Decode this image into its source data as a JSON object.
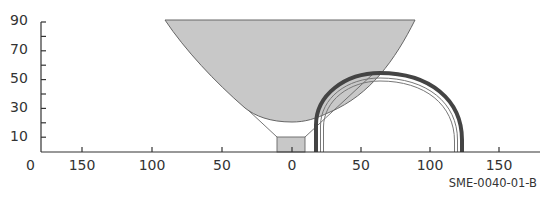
{
  "figure": {
    "code_label": "SME-0040-01-B",
    "colors": {
      "axis": "#333333",
      "bowl_fill": "#c8c8c8",
      "bowl_stroke": "#666666",
      "arch_outer": "#444444",
      "arch_inner": "#777777",
      "base_fill": "#c8c8c8"
    }
  },
  "axes": {
    "y_ticks": [
      "90",
      "70",
      "50",
      "30",
      "10",
      "0"
    ],
    "x_ticks": [
      "150",
      "100",
      "50",
      "0",
      "50",
      "100",
      "150"
    ]
  },
  "shapes": {
    "bowl": "parabolic gray filled funnel, top at 90, spanning ~-92 to ~88",
    "base": "small gray rectangle at x -10 to 10, height ~10",
    "arch": "semi-circular multi-line arch from ~16 to ~124, top ~55"
  }
}
